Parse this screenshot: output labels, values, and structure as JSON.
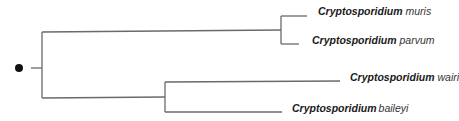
{
  "diagram": {
    "type": "phylogenetic-tree",
    "root_marker": "filled-circle",
    "colors": {
      "branch": "#6a6a6a",
      "root_dot": "#111111",
      "text": "#1a1a1a"
    },
    "taxa": [
      {
        "genus": "Cryptosporidium",
        "species": "muris"
      },
      {
        "genus": "Cryptosporidium",
        "species": "parvum"
      },
      {
        "genus": "Cryptosporidium",
        "species": "wairi"
      },
      {
        "genus": "Cryptosporidium",
        "species": "baileyi"
      }
    ],
    "topology": "((muris, parvum), (wairi, baileyi))"
  }
}
